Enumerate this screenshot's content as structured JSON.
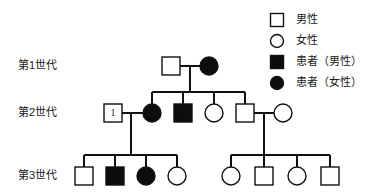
{
  "figure": {
    "type": "pedigree-chart",
    "width": 383,
    "height": 195,
    "background": "#ffffff",
    "line_color": "#111111",
    "affected_fill": "#0d0d0d",
    "unaffected_fill": "#ffffff"
  },
  "generations": [
    {
      "id": "gen1",
      "label": "第1世代",
      "label_x": 18,
      "label_y": 66
    },
    {
      "id": "gen2",
      "label": "第2世代",
      "label_x": 18,
      "label_y": 113
    },
    {
      "id": "gen3",
      "label": "第3世代",
      "label_x": 18,
      "label_y": 176
    }
  ],
  "legend": {
    "items": [
      {
        "shape": "square",
        "affected": false,
        "label": "男性",
        "sym_x": 277,
        "sym_y": 20,
        "text_x": 296,
        "text_y": 20
      },
      {
        "shape": "circle",
        "affected": false,
        "label": "女性",
        "sym_x": 277,
        "sym_y": 41,
        "text_x": 296,
        "text_y": 41
      },
      {
        "shape": "square",
        "affected": true,
        "label": "患者（男性）",
        "sym_x": 277,
        "sym_y": 62,
        "text_x": 296,
        "text_y": 62
      },
      {
        "shape": "circle",
        "affected": true,
        "label": "患者（女性）",
        "sym_x": 277,
        "sym_y": 83,
        "text_x": 296,
        "text_y": 83
      }
    ]
  },
  "individuals": [
    {
      "id": "I-1",
      "generation": 1,
      "shape": "square",
      "affected": false,
      "cx": 171,
      "cy": 66,
      "size": 18,
      "badge": ""
    },
    {
      "id": "I-2",
      "generation": 1,
      "shape": "circle",
      "affected": true,
      "cx": 209,
      "cy": 66,
      "size": 18,
      "badge": ""
    },
    {
      "id": "II-1",
      "generation": 2,
      "shape": "square",
      "affected": false,
      "cx": 113,
      "cy": 113,
      "size": 18,
      "badge": "1"
    },
    {
      "id": "II-2",
      "generation": 2,
      "shape": "circle",
      "affected": true,
      "cx": 152,
      "cy": 113,
      "size": 18,
      "badge": ""
    },
    {
      "id": "II-3",
      "generation": 2,
      "shape": "square",
      "affected": true,
      "cx": 183,
      "cy": 113,
      "size": 18,
      "badge": ""
    },
    {
      "id": "II-4",
      "generation": 2,
      "shape": "circle",
      "affected": false,
      "cx": 214,
      "cy": 113,
      "size": 18,
      "badge": ""
    },
    {
      "id": "II-5",
      "generation": 2,
      "shape": "square",
      "affected": false,
      "cx": 245,
      "cy": 113,
      "size": 18,
      "badge": ""
    },
    {
      "id": "II-6",
      "generation": 2,
      "shape": "circle",
      "affected": false,
      "cx": 283,
      "cy": 113,
      "size": 18,
      "badge": ""
    },
    {
      "id": "III-1",
      "generation": 3,
      "shape": "square",
      "affected": false,
      "cx": 84,
      "cy": 176,
      "size": 18,
      "badge": ""
    },
    {
      "id": "III-2",
      "generation": 3,
      "shape": "square",
      "affected": true,
      "cx": 115,
      "cy": 176,
      "size": 18,
      "badge": ""
    },
    {
      "id": "III-3",
      "generation": 3,
      "shape": "circle",
      "affected": true,
      "cx": 146,
      "cy": 176,
      "size": 18,
      "badge": ""
    },
    {
      "id": "III-4",
      "generation": 3,
      "shape": "circle",
      "affected": false,
      "cx": 177,
      "cy": 176,
      "size": 18,
      "badge": ""
    },
    {
      "id": "III-5",
      "generation": 3,
      "shape": "circle",
      "affected": false,
      "cx": 231,
      "cy": 176,
      "size": 18,
      "badge": ""
    },
    {
      "id": "III-6",
      "generation": 3,
      "shape": "square",
      "affected": false,
      "cx": 264,
      "cy": 176,
      "size": 18,
      "badge": ""
    },
    {
      "id": "III-7",
      "generation": 3,
      "shape": "circle",
      "affected": false,
      "cx": 297,
      "cy": 176,
      "size": 18,
      "badge": ""
    },
    {
      "id": "III-8",
      "generation": 3,
      "shape": "square",
      "affected": false,
      "cx": 330,
      "cy": 176,
      "size": 18,
      "badge": ""
    }
  ],
  "connectors": [
    {
      "name": "gen1-mating-line",
      "type": "h",
      "x1": 180,
      "x2": 200,
      "y": 66
    },
    {
      "name": "gen1-descent-line",
      "type": "v",
      "x": 190,
      "y1": 66,
      "y2": 92
    },
    {
      "name": "gen2-sibship-line",
      "type": "h",
      "x1": 152,
      "x2": 245,
      "y": 92
    },
    {
      "name": "gen2-drop-ii2",
      "type": "v",
      "x": 152,
      "y1": 92,
      "y2": 104
    },
    {
      "name": "gen2-drop-ii3",
      "type": "v",
      "x": 183,
      "y1": 92,
      "y2": 104
    },
    {
      "name": "gen2-drop-ii4",
      "type": "v",
      "x": 214,
      "y1": 92,
      "y2": 104
    },
    {
      "name": "gen2-drop-ii5",
      "type": "v",
      "x": 245,
      "y1": 92,
      "y2": 104
    },
    {
      "name": "gen2-mating-left",
      "type": "h",
      "x1": 122,
      "x2": 143,
      "y": 113
    },
    {
      "name": "gen2-descent-left",
      "type": "v",
      "x": 131,
      "y1": 113,
      "y2": 155
    },
    {
      "name": "gen3-sibship-left",
      "type": "h",
      "x1": 84,
      "x2": 177,
      "y": 155
    },
    {
      "name": "gen3-drop-iii1",
      "type": "v",
      "x": 84,
      "y1": 155,
      "y2": 167
    },
    {
      "name": "gen3-drop-iii2",
      "type": "v",
      "x": 115,
      "y1": 155,
      "y2": 167
    },
    {
      "name": "gen3-drop-iii3",
      "type": "v",
      "x": 146,
      "y1": 155,
      "y2": 167
    },
    {
      "name": "gen3-drop-iii4",
      "type": "v",
      "x": 177,
      "y1": 155,
      "y2": 167
    },
    {
      "name": "gen2-mating-right",
      "type": "h",
      "x1": 254,
      "x2": 274,
      "y": 113
    },
    {
      "name": "gen2-descent-right",
      "type": "v",
      "x": 264,
      "y1": 113,
      "y2": 155
    },
    {
      "name": "gen3-sibship-right",
      "type": "h",
      "x1": 231,
      "x2": 330,
      "y": 155
    },
    {
      "name": "gen3-drop-iii5",
      "type": "v",
      "x": 231,
      "y1": 155,
      "y2": 167
    },
    {
      "name": "gen3-drop-iii6",
      "type": "v",
      "x": 264,
      "y1": 155,
      "y2": 167
    },
    {
      "name": "gen3-drop-iii7",
      "type": "v",
      "x": 297,
      "y1": 155,
      "y2": 167
    },
    {
      "name": "gen3-drop-iii8",
      "type": "v",
      "x": 330,
      "y1": 155,
      "y2": 167
    }
  ]
}
